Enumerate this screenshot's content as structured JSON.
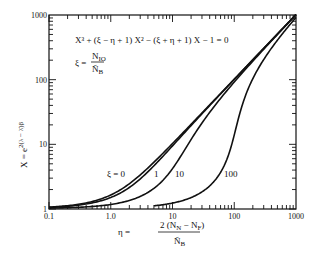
{
  "chart_data": {
    "type": "line",
    "title": "",
    "equation": "X^3 + (ξ − η + 1) X^2 − (ξ + η + 1) X − 1 = 0",
    "xi_definition": "ξ = N_IO / Ñ_B",
    "xlabel": "η = 2(N_N − N_F) / Ñ_B",
    "ylabel": "X = e^{2(λ − λ̂)β}",
    "xscale": "log",
    "yscale": "log",
    "xlim": [
      0.1,
      1000
    ],
    "ylim": [
      1,
      1000
    ],
    "x_ticks": [
      "0.1",
      "1.0",
      "10",
      "100",
      "1000"
    ],
    "y_ticks": [
      "1",
      "10",
      "100",
      "1000"
    ],
    "grid": false,
    "series": [
      {
        "name": "ξ = 0",
        "label": "ξ = 0",
        "xi": 0,
        "x": [
          0.1,
          0.3,
          1,
          3,
          10,
          30,
          100,
          300,
          1000
        ],
        "y": [
          1.05,
          1.16,
          1.62,
          3.3,
          10.1,
          30.0,
          100,
          300,
          1000
        ]
      },
      {
        "name": "ξ = 1",
        "label": "1",
        "xi": 1,
        "x": [
          0.1,
          0.3,
          1,
          3,
          10,
          30,
          100,
          300,
          1000
        ],
        "y": [
          1.03,
          1.1,
          1.4,
          2.6,
          8.5,
          28.5,
          99,
          299,
          999
        ]
      },
      {
        "name": "ξ = 10",
        "label": "10",
        "xi": 10,
        "x": [
          0.1,
          0.3,
          1,
          3,
          10,
          30,
          100,
          300,
          1000
        ],
        "y": [
          1.0,
          1.03,
          1.1,
          1.35,
          2.7,
          18,
          89,
          289,
          989
        ]
      },
      {
        "name": "ξ = 100",
        "label": "100",
        "xi": 100,
        "x": [
          5,
          10,
          30,
          60,
          100,
          150,
          200,
          300,
          1000
        ],
        "y": [
          1.04,
          1.11,
          1.4,
          2.4,
          5.5,
          50,
          100,
          200,
          900
        ]
      }
    ]
  },
  "labels": {
    "equation": "X³ + (ξ − η + 1) X² − (ξ + η + 1) X − 1 = 0",
    "xi_lhs": "ξ =",
    "xi_num": "N",
    "xi_num_sub": "IO",
    "xi_den": "Ñ",
    "xi_den_sub": "B",
    "eta_lhs": "η =",
    "eta_num": "2 (N",
    "eta_num_sub1": "N",
    "eta_num_mid": " − N",
    "eta_num_sub2": "F",
    "eta_num_end": ")",
    "eta_den": "Ñ",
    "eta_den_sub": "B",
    "ylabel": "X = e",
    "ylabel_exp": "2(λ − λ̂)β",
    "curve_label_xi0": "ξ = 0",
    "curve_label_xi1": "1",
    "curve_label_xi10": "10",
    "curve_label_xi100": "100"
  }
}
